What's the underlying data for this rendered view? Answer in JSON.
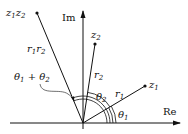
{
  "diagram": {
    "type": "complex-plane-multiplication",
    "axes": {
      "real_label": "Re",
      "imag_label": "Im",
      "origin": [
        83,
        123
      ]
    },
    "points": [
      {
        "id": "z1",
        "label_base": "z",
        "label_sub": "1",
        "pos": [
          145,
          86
        ]
      },
      {
        "id": "z2",
        "label_base": "z",
        "label_sub": "2",
        "pos": [
          95,
          44
        ]
      },
      {
        "id": "z1z2",
        "label": "z1z2",
        "pos": [
          37,
          13
        ]
      }
    ],
    "vectors": [
      {
        "to": "z1",
        "length_label_base": "r",
        "length_label_sub": "1"
      },
      {
        "to": "z2",
        "length_label_base": "r",
        "length_label_sub": "2"
      },
      {
        "to": "z1z2",
        "length_label": "r1r2"
      }
    ],
    "angles": [
      {
        "label_base": "θ",
        "label_sub": "1"
      },
      {
        "label_base": "θ",
        "label_sub": "2"
      },
      {
        "label": "θ1 + θ2"
      }
    ]
  }
}
